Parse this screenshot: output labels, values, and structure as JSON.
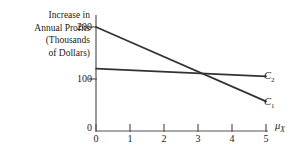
{
  "chart_data": {
    "type": "line",
    "title": "",
    "subtitle": "",
    "ylabel_lines": [
      "Increase in",
      "Annual Profits",
      "(Thousands",
      "of Dollars)"
    ],
    "ylabel": "Increase in Annual Profits (Thousands of Dollars)",
    "xlabel": "μ",
    "xlabel_sub": "X",
    "x": [
      0,
      1,
      2,
      3,
      4,
      5
    ],
    "xticklabels": [
      "0",
      "1",
      "2",
      "3",
      "4",
      "5"
    ],
    "yticks": [
      0,
      100,
      200
    ],
    "yticklabels": [
      "0",
      "100",
      "200"
    ],
    "xlim": [
      0,
      5
    ],
    "ylim": [
      0,
      222
    ],
    "grid": false,
    "legend_position": "right-end-of-line",
    "series": [
      {
        "name": "C",
        "name_sub": "1",
        "label": "C₁",
        "endpoints": [
          [
            0,
            200
          ],
          [
            5,
            57
          ]
        ],
        "values": [
          200,
          171,
          143,
          114,
          86,
          57
        ],
        "color": "#333333"
      },
      {
        "name": "C",
        "name_sub": "2",
        "label": "C₂",
        "endpoints": [
          [
            0,
            120
          ],
          [
            5,
            105
          ]
        ],
        "values": [
          120,
          117,
          114,
          111,
          108,
          105
        ],
        "color": "#333333"
      }
    ],
    "annotations": [
      {
        "text": "crossing point",
        "x": 3,
        "y": 110
      }
    ],
    "axis_color": "#555555",
    "line_color": "#333333",
    "background": "#ffffff"
  }
}
